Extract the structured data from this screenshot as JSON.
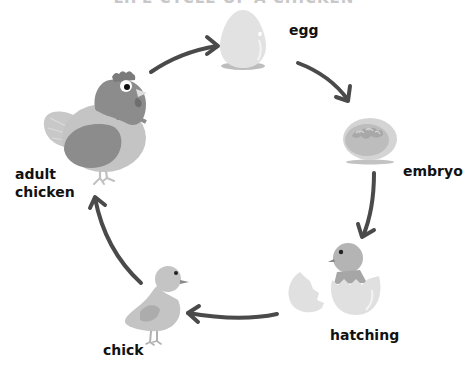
{
  "diagram": {
    "title": "LIFE CYCLE OF A CHICKEN",
    "type": "cycle",
    "stages": [
      {
        "id": "egg",
        "label": "egg"
      },
      {
        "id": "embryo",
        "label": "embryo"
      },
      {
        "id": "hatching",
        "label": "hatching"
      },
      {
        "id": "chick",
        "label": "chick"
      },
      {
        "id": "adult",
        "label_line1": "adult",
        "label_line2": "chicken"
      }
    ],
    "arrows": [
      {
        "from": "adult",
        "to": "egg"
      },
      {
        "from": "egg",
        "to": "embryo"
      },
      {
        "from": "embryo",
        "to": "hatching"
      },
      {
        "from": "hatching",
        "to": "chick"
      },
      {
        "from": "chick",
        "to": "adult"
      }
    ],
    "colors": {
      "arrow": "#4a4a4a",
      "shell": "#e3e3e3",
      "light_gray": "#c9c9c9",
      "mid_gray": "#9a9a9a",
      "dark_gray": "#808080",
      "text": "#111111"
    }
  }
}
